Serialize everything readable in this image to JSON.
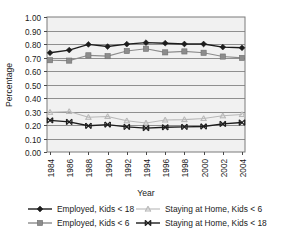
{
  "chart_data": {
    "type": "line",
    "title": "",
    "xlabel": "Year",
    "ylabel": "Percentage",
    "ylim": [
      0.0,
      1.0
    ],
    "ytick_step": 0.1,
    "grid": true,
    "grid_orientation": "horizontal",
    "legend_position": "bottom",
    "plot_background": "#f1f1f1",
    "categories": [
      "1984",
      "1986",
      "1988",
      "1990",
      "1992",
      "1994",
      "1996",
      "1998",
      "2000",
      "2002",
      "2004"
    ],
    "ytick_labels": [
      "1.00",
      "0.90",
      "0.80",
      "0.70",
      "0.60",
      "0.50",
      "0.40",
      "0.30",
      "0.20",
      "0.10",
      "0.00"
    ],
    "series": [
      {
        "name": "Employed, Kids < 18",
        "marker": "diamond",
        "color": "#1c1c1c",
        "values": [
          0.735,
          0.755,
          0.797,
          0.781,
          0.799,
          0.81,
          0.806,
          0.8,
          0.8,
          0.777,
          0.772
        ]
      },
      {
        "name": "Employed, Kids < 6",
        "marker": "square",
        "color": "#8c8c8c",
        "values": [
          0.68,
          0.677,
          0.716,
          0.71,
          0.748,
          0.765,
          0.738,
          0.745,
          0.735,
          0.707,
          0.697
        ]
      },
      {
        "name": "Staying at Home, Kids < 6",
        "marker": "asterisk",
        "color": "#b9b9b9",
        "values": [
          0.294,
          0.3,
          0.257,
          0.263,
          0.231,
          0.215,
          0.237,
          0.24,
          0.248,
          0.268,
          0.278
        ]
      },
      {
        "name": "Staying at Home, Kids < 18",
        "marker": "bowtie",
        "color": "#1c1c1c",
        "values": [
          0.234,
          0.223,
          0.194,
          0.203,
          0.186,
          0.177,
          0.183,
          0.186,
          0.189,
          0.208,
          0.218
        ]
      }
    ]
  },
  "legend": {
    "entries": [
      {
        "label": "Employed, Kids < 18"
      },
      {
        "label": "Staying at Home, Kids < 6"
      },
      {
        "label": "Employed, Kids < 6"
      },
      {
        "label": "Staying at Home, Kids < 18"
      }
    ]
  },
  "axes": {
    "y_title": "Percentage",
    "x_title": "Year"
  }
}
